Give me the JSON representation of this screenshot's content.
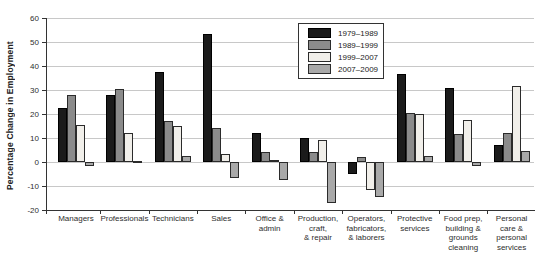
{
  "chart_data": {
    "type": "bar",
    "title": "",
    "xlabel": "",
    "ylabel": "Percentage Change in Employment",
    "ylim": [
      -20,
      60
    ],
    "ytick_step": 10,
    "grid": true,
    "legend_position": "top-center",
    "categories": [
      "Managers",
      "Professionals",
      "Technicians",
      "Sales",
      "Office & admin",
      "Production, craft, & repair",
      "Operators, fabricators, & laborers",
      "Protective services",
      "Food prep, building & grounds cleaning",
      "Personal care & personal services"
    ],
    "category_lines": [
      [
        "Managers"
      ],
      [
        "Professionals"
      ],
      [
        "Technicians"
      ],
      [
        "Sales"
      ],
      [
        "Office &",
        "admin"
      ],
      [
        "Production,",
        "craft,",
        "& repair"
      ],
      [
        "Operators,",
        "fabricators,",
        "& laborers"
      ],
      [
        "Protective",
        "services"
      ],
      [
        "Food prep,",
        "building &",
        "grounds",
        "cleaning"
      ],
      [
        "Personal",
        "care &",
        "personal",
        "services"
      ]
    ],
    "series": [
      {
        "name": "1979–1989",
        "color": "#1b1b1b",
        "border": "#000000",
        "values": [
          22.5,
          28,
          37.5,
          53.5,
          12,
          10,
          -5,
          36.5,
          31,
          7
        ]
      },
      {
        "name": "1989–1999",
        "color": "#8b8b8b",
        "border": "#2b2b2b",
        "values": [
          28,
          30.5,
          17,
          14,
          4,
          4,
          2,
          20.5,
          11.5,
          12
        ]
      },
      {
        "name": "1999–2007",
        "color": "#f1efea",
        "border": "#2b2b2b",
        "values": [
          15.5,
          12,
          15,
          3.5,
          1,
          9,
          -11.5,
          20,
          17.5,
          31.5
        ]
      },
      {
        "name": "2007–2009",
        "color": "#a9a9a9",
        "border": "#2b2b2b",
        "values": [
          -1.5,
          0.5,
          2.5,
          -6.5,
          -7.5,
          -17,
          -14.5,
          2.5,
          -1.5,
          4.5
        ]
      }
    ],
    "colors": {
      "gridline": "#c8c8c8",
      "axis": "#333333",
      "text": "#2e2e2e",
      "background": "#ffffff"
    }
  }
}
